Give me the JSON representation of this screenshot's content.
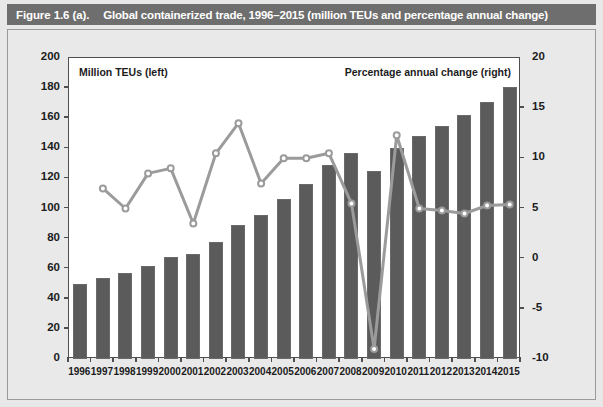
{
  "figure": {
    "number_label": "Figure 1.6 (a).",
    "caption": "Global containerized trade, 1996–2015 (million TEUs and percentage annual change)"
  },
  "legend": {
    "left_series_label": "Million TEUs (left)",
    "right_series_label": "Percentage annual change (right)"
  },
  "axes": {
    "left_ticks": [
      "0",
      "20",
      "40",
      "60",
      "80",
      "100",
      "120",
      "140",
      "160",
      "180",
      "200"
    ],
    "right_ticks": [
      "-10",
      "-5",
      "0",
      "5",
      "10",
      "15",
      "20"
    ],
    "x_ticks": [
      "1996",
      "1997",
      "1998",
      "1999",
      "2000",
      "2001",
      "2002",
      "2003",
      "2004",
      "2005",
      "2006",
      "2007",
      "2008",
      "2009",
      "2010",
      "2011",
      "2012",
      "2013",
      "2014",
      "2015"
    ]
  },
  "colors": {
    "title_bar": "#6e6e6e",
    "panel_background": "#e9e9e9",
    "plot_background": "#ffffff",
    "bar_fill": "#5b5b5b",
    "line_stroke": "#9b9b9b",
    "marker_fill": "#ffffff",
    "axis": "#4f4f4f",
    "text": "#1c1c1c"
  },
  "chart_data": {
    "type": "bar",
    "title": "Global containerized trade, 1996–2015 (million TEUs and percentage annual change)",
    "xlabel": "",
    "ylabel": "Million TEUs (left)",
    "y2label": "Percentage annual change (right)",
    "ylim": [
      0,
      200
    ],
    "y2lim": [
      -10,
      20
    ],
    "grid": false,
    "legend_position": "in-plot-top",
    "categories": [
      "1996",
      "1997",
      "1998",
      "1999",
      "2000",
      "2001",
      "2002",
      "2003",
      "2004",
      "2005",
      "2006",
      "2007",
      "2008",
      "2009",
      "2010",
      "2011",
      "2012",
      "2013",
      "2014",
      "2015"
    ],
    "series": [
      {
        "name": "Million TEUs (left)",
        "type": "bar",
        "axis": "left",
        "values": [
          50,
          54,
          57,
          62,
          68,
          70,
          78,
          89,
          96,
          106,
          116,
          129,
          137,
          125,
          140,
          148,
          155,
          162,
          171,
          181
        ]
      },
      {
        "name": "Percentage annual change (right)",
        "type": "line",
        "axis": "right",
        "values": [
          null,
          7.0,
          5.0,
          8.5,
          9.0,
          3.5,
          10.5,
          13.5,
          7.5,
          10.0,
          10.0,
          10.5,
          5.5,
          -9.0,
          12.3,
          5.0,
          4.8,
          4.5,
          5.3,
          5.4
        ]
      }
    ]
  }
}
